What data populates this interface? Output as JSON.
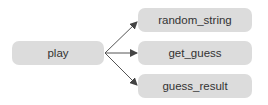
{
  "diagram": {
    "type": "call-graph",
    "source": {
      "id": "play",
      "label": "play"
    },
    "targets": [
      {
        "id": "random_string",
        "label": "random_string"
      },
      {
        "id": "get_guess",
        "label": "get_guess"
      },
      {
        "id": "guess_result",
        "label": "guess_result"
      }
    ],
    "edges": [
      {
        "from": "play",
        "to": "random_string"
      },
      {
        "from": "play",
        "to": "get_guess"
      },
      {
        "from": "play",
        "to": "guess_result"
      }
    ],
    "colors": {
      "node_fill": "#dcdcdc",
      "edge": "#444444",
      "text": "#333333"
    }
  }
}
